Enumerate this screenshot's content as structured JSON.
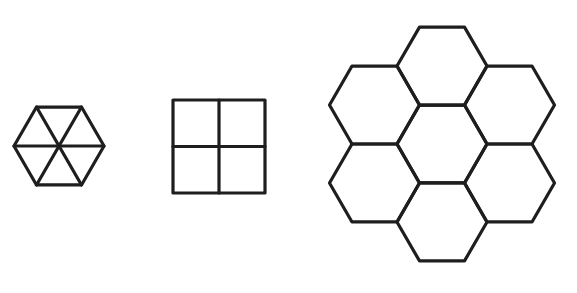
{
  "figure": {
    "stroke_color": "#1e1e1e",
    "background": "#ffffff",
    "shapes": [
      {
        "id": "hexagon-of-triangles",
        "label": "Hexagon divided into 6 equilateral triangles",
        "center": [
          59,
          146
        ],
        "radius": 45,
        "subdivisions": 6
      },
      {
        "id": "square-of-squares",
        "label": "Square divided into 4 squares",
        "x": 173,
        "y": 100,
        "width": 92,
        "height": 93,
        "subdivisions": 4
      },
      {
        "id": "hexagon-cluster",
        "label": "Seven hexagons tiled around a central hexagon",
        "center": [
          442,
          144
        ],
        "hex_radius": 45,
        "count": 7
      }
    ]
  }
}
